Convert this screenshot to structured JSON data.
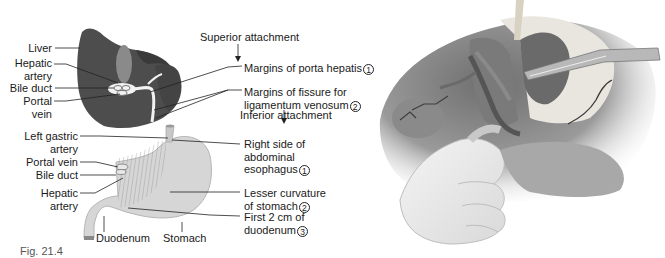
{
  "left_figure": {
    "liver_labels": {
      "liver": "Liver",
      "hepatic_artery": [
        "Hepatic",
        "artery"
      ],
      "bile_duct": "Bile duct",
      "portal_vein": [
        "Portal",
        "vein"
      ]
    },
    "superior_attachment": {
      "heading": "Superior attachment",
      "items": [
        {
          "text": "Margins of porta hepatis",
          "num": "1"
        },
        {
          "text": [
            "Margins of fissure for",
            "ligamentum venosum"
          ],
          "num": "2"
        }
      ]
    },
    "inferior_attachment": {
      "heading": "Inferior attachment",
      "items": [
        {
          "text": [
            "Right side of",
            "abdominal",
            "esophagus"
          ],
          "num": "1"
        },
        {
          "text": [
            "Lesser curvature",
            "of stomach"
          ],
          "num": "2"
        },
        {
          "text": [
            "First 2 cm of",
            "duodenum"
          ],
          "num": "3"
        }
      ]
    },
    "stomach_labels": {
      "left_gastric_artery": [
        "Left gastric",
        "artery"
      ],
      "portal_vein": "Portal vein",
      "bile_duct": "Bile duct",
      "hepatic_artery": [
        "Hepatic",
        "artery"
      ],
      "duodenum": "Duodenum",
      "stomach": "Stomach"
    },
    "caption_fragment": "Fig. 21.4"
  },
  "right_figure": {
    "description": "surgical illustration: hand retracting viscera exposing gallbladder, hepatic vessels and forceps"
  },
  "colors": {
    "liver": "#505050",
    "liver_dark": "#3a3a3a",
    "gallbladder": "#8a8a8a",
    "stomach": "#d6d6d6",
    "stomach_edge": "#b5b5b5",
    "text": "#1a1a1a",
    "background": "#ffffff"
  }
}
